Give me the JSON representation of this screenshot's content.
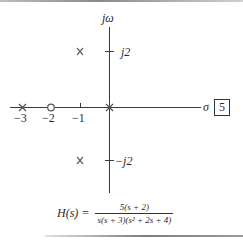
{
  "figure": {
    "axes": {
      "vertical_label": "jω",
      "horizontal_label": "σ",
      "x_ticks": [
        "−3",
        "−2",
        "−1"
      ],
      "y_ticks": [
        "j2",
        "−j2"
      ]
    },
    "figure_number": "5",
    "poles": [
      {
        "re": 0,
        "im": 0
      },
      {
        "re": -3,
        "im": 0
      },
      {
        "re": -1,
        "im": 2
      },
      {
        "re": -1,
        "im": -2
      }
    ],
    "zeros": [
      {
        "re": -2,
        "im": 0
      }
    ],
    "transfer_function": {
      "lhs": "H(s) =",
      "numerator": "5(s + 2)",
      "denominator": "s(s + 3)(s² + 2s + 4)"
    },
    "colors": {
      "axis": "#3a3a3a",
      "marker": "#555555",
      "text": "#2a2a2a"
    }
  }
}
